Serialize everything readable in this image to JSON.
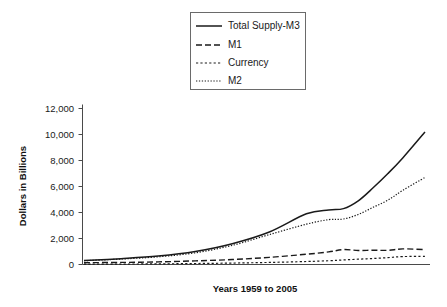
{
  "chart_data": {
    "type": "line",
    "title": "",
    "xlabel": "Years 1959 to 2005",
    "ylabel": "Dollars in Billions",
    "ylim": [
      0,
      12000
    ],
    "xlim": [
      1959,
      2005
    ],
    "grid": false,
    "legend_position": "top-center",
    "ytick_labels": [
      "12,000",
      "10,000",
      "8,000",
      "6,000",
      "4,000",
      "2,000",
      "0"
    ],
    "ytick_values": [
      12000,
      10000,
      8000,
      6000,
      4000,
      2000,
      0
    ],
    "x": [
      1959,
      1964,
      1969,
      1974,
      1979,
      1984,
      1989,
      1992,
      1994,
      1996,
      1998,
      2000,
      2002,
      2005
    ],
    "series": [
      {
        "name": "Total Supply-M3",
        "style": "solid",
        "values": [
          300,
          450,
          650,
          1000,
          1600,
          2500,
          3900,
          4200,
          4300,
          4900,
          5900,
          7000,
          8200,
          10200
        ]
      },
      {
        "name": "M1",
        "style": "dashed",
        "values": [
          140,
          160,
          200,
          280,
          380,
          550,
          790,
          970,
          1150,
          1080,
          1100,
          1090,
          1200,
          1150
        ]
      },
      {
        "name": "Currency",
        "style": "dotted",
        "values": [
          30,
          35,
          48,
          75,
          110,
          160,
          230,
          290,
          350,
          410,
          460,
          530,
          610,
          620
        ]
      },
      {
        "name": "M2",
        "style": "fine-dotted",
        "values": [
          290,
          420,
          590,
          900,
          1470,
          2300,
          3100,
          3450,
          3500,
          3850,
          4400,
          4950,
          5700,
          6700
        ]
      }
    ]
  },
  "legend": {
    "items": [
      {
        "label": "Total Supply-M3",
        "style": "solid"
      },
      {
        "label": "M1",
        "style": "dashed"
      },
      {
        "label": "Currency",
        "style": "dotted"
      },
      {
        "label": "M2",
        "style": "fine-dotted"
      }
    ]
  },
  "axes": {
    "y_title": "Dollars in Billions",
    "x_title": "Years 1959 to 2005",
    "y_labels": [
      "12,000",
      "10,000",
      "8,000",
      "6,000",
      "4,000",
      "2,000",
      "0"
    ]
  },
  "colors": {
    "line": "#1a1a1a",
    "axis": "#4a4a4a",
    "background": "#ffffff",
    "legend_border": "#6a6a6a"
  }
}
